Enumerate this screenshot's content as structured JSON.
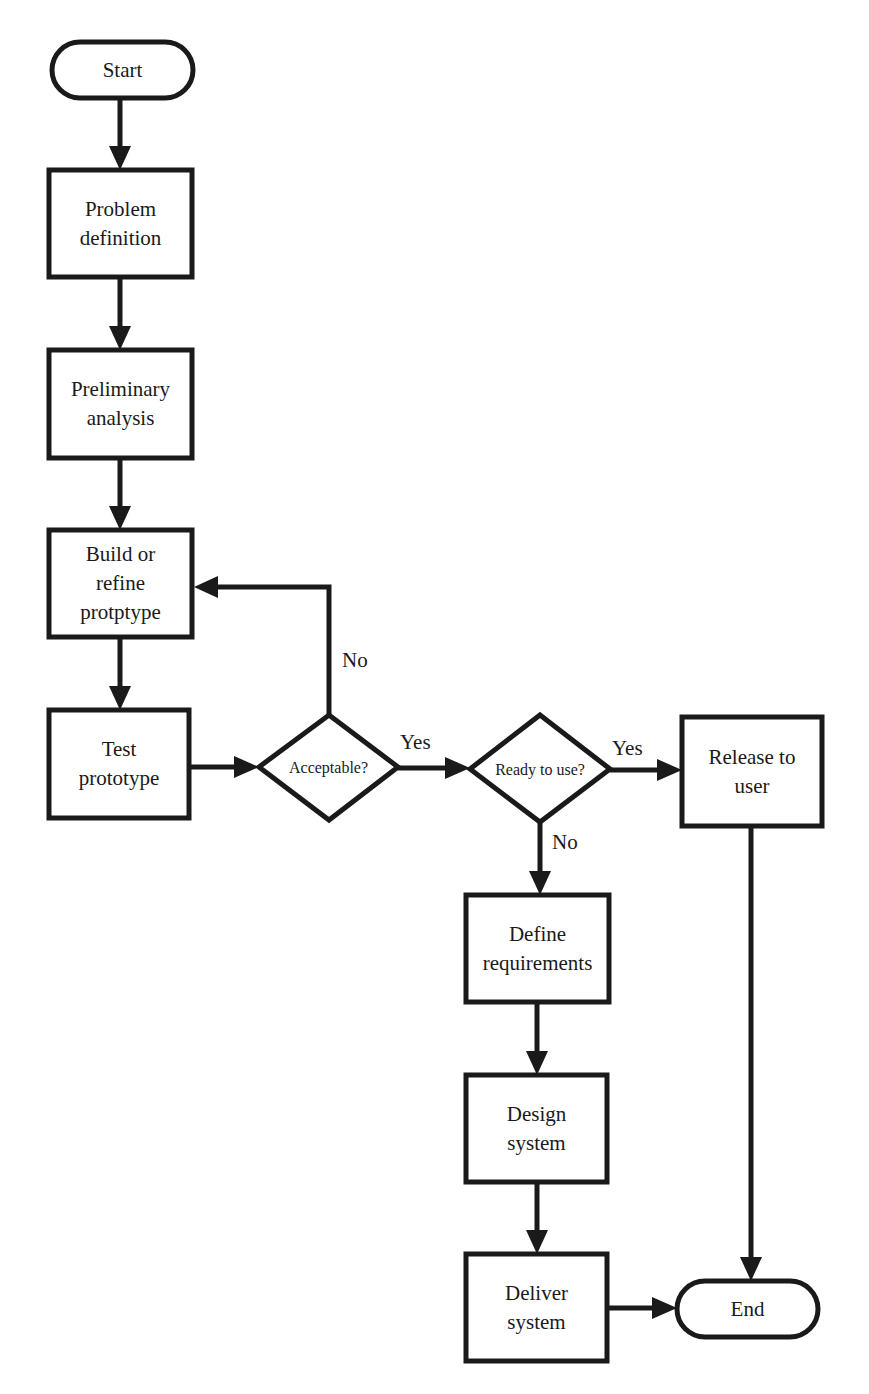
{
  "nodes": {
    "start": {
      "lines": [
        "Start"
      ]
    },
    "problem": {
      "lines": [
        "Problem",
        "definition"
      ]
    },
    "prelim": {
      "lines": [
        "Preliminary",
        "analysis"
      ]
    },
    "build": {
      "lines": [
        "Build or",
        "refine",
        "protptype"
      ]
    },
    "test": {
      "lines": [
        "Test",
        "prototype"
      ]
    },
    "acceptable": {
      "lines": [
        "Acceptable?"
      ]
    },
    "ready": {
      "lines": [
        "Ready to use?"
      ]
    },
    "release": {
      "lines": [
        "Release to",
        "user"
      ]
    },
    "define": {
      "lines": [
        "Define",
        "requirements"
      ]
    },
    "design": {
      "lines": [
        "Design",
        "system"
      ]
    },
    "deliver": {
      "lines": [
        "Deliver",
        "system"
      ]
    },
    "end": {
      "lines": [
        "End"
      ]
    }
  },
  "labels": {
    "acceptable_no": "No",
    "acceptable_yes": "Yes",
    "ready_yes": "Yes",
    "ready_no": "No"
  },
  "colors": {
    "stroke": "#1a1a1a",
    "background": "#ffffff"
  }
}
